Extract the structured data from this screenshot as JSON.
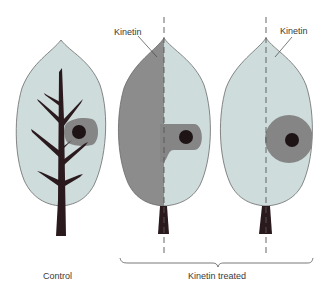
{
  "labels": {
    "kinetin_middle": "Kinetin",
    "kinetin_right": "Kinetin",
    "control": "Control",
    "kinetin_treated": "Kinetin treated"
  },
  "colors": {
    "leaf_light": "#cfdcdc",
    "leaf_dark": "#8c8c8c",
    "halo": "#858585",
    "spot": "#1e1416",
    "vein": "#2a1a1e",
    "outline": "#6a6a6a",
    "text": "#3a3a3a"
  },
  "leaves": [
    {
      "id": "control",
      "description": "Untreated leaf with radioactive spot; label diffuses toward veins"
    },
    {
      "id": "half-treated",
      "description": "Left half treated with kinetin; label accumulates in treated half"
    },
    {
      "id": "spot-treated",
      "description": "Kinetin applied at spot; label retained around spot"
    }
  ]
}
